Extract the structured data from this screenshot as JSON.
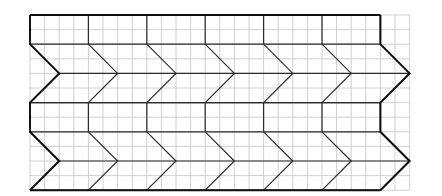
{
  "diagram": {
    "columns": 6,
    "tile_rows": 2,
    "grid_units": {
      "tile_width_cells": 4,
      "rect_height_cells": 2,
      "chevron_half_height_cells": 2,
      "chevron_depth_cells": 2
    },
    "colors": {
      "grid": "#c4c4c4",
      "tile_lines": "#2a2a2a",
      "outline": "#111111",
      "background": "#ffffff"
    }
  }
}
